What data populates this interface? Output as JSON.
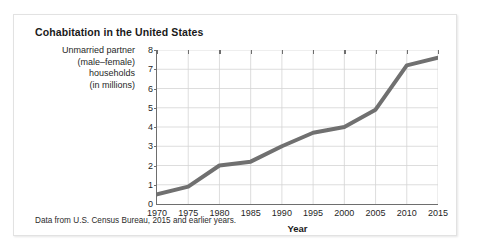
{
  "figure": {
    "title": "Cohabitation in the United States",
    "source_note": "Data from U.S. Census Bureau, 2015 and earlier years.",
    "y_caption_lines": [
      "Unmarried partner",
      "(male–female)",
      "households",
      "(in millions)"
    ],
    "accent_color": "#6e6e6e",
    "line_color": "#707070",
    "grid_color": "#d4d4d4",
    "axis_color": "#6e6e6e"
  },
  "chart_data": {
    "type": "line",
    "title": "Cohabitation in the United States",
    "subtitle": "",
    "xlabel": "Year",
    "ylabel": "Unmarried partner (male–female) households (in millions)",
    "x": [
      1970,
      1975,
      1980,
      1985,
      1990,
      1995,
      2000,
      2005,
      2010,
      2015
    ],
    "values": [
      0.5,
      0.9,
      2.0,
      2.2,
      3.0,
      3.7,
      4.0,
      4.9,
      7.2,
      7.6
    ],
    "xtick_labels": [
      "1970",
      "1975",
      "1980",
      "1985",
      "1990",
      "1995",
      "2000",
      "2005",
      "2010",
      "2015"
    ],
    "ytick_labels": [
      "0",
      "1",
      "2",
      "3",
      "4",
      "5",
      "6",
      "7",
      "8"
    ],
    "yticks": [
      0,
      1,
      2,
      3,
      4,
      5,
      6,
      7,
      8
    ],
    "xlim": [
      1970,
      2015
    ],
    "ylim": [
      0,
      8
    ],
    "grid": true,
    "legend": false,
    "legend_position": "none",
    "annotations": [
      "Data from U.S. Census Bureau, 2015 and earlier years."
    ]
  }
}
